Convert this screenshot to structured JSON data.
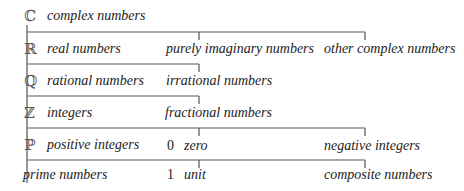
{
  "diagram": {
    "rows": [
      {
        "symbol": "ℂ",
        "label": "complex numbers"
      },
      {
        "symbol": "ℝ",
        "label": "real numbers",
        "branch_label": "purely imaginary numbers",
        "far_label": "other complex numbers"
      },
      {
        "symbol": "ℚ",
        "label": "rational numbers",
        "branch_label": "irrational numbers"
      },
      {
        "symbol": "ℤ",
        "label": "integers",
        "branch_label": "fractional numbers"
      },
      {
        "symbol": "ℙ",
        "label": "positive integers",
        "branch_number": "0",
        "branch_label": "zero",
        "far_label": "negative integers"
      },
      {
        "label": "prime numbers",
        "branch_number": "1",
        "branch_label": "unit",
        "far_label": "composite numbers"
      }
    ],
    "line_color": "#555555"
  }
}
